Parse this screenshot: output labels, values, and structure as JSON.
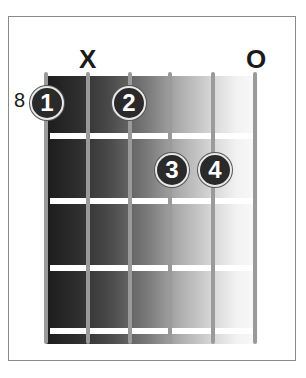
{
  "diagram": {
    "type": "guitar-chord-chart",
    "starting_fret_label": "8",
    "string_markers": [
      {
        "string": 2,
        "label": "X",
        "meaning": "muted"
      },
      {
        "string": 6,
        "label": "O",
        "meaning": "open"
      }
    ],
    "fingers": [
      {
        "label": "1",
        "string": 1,
        "fret": 1
      },
      {
        "label": "2",
        "string": 3,
        "fret": 1
      },
      {
        "label": "3",
        "string": 4,
        "fret": 2
      },
      {
        "label": "4",
        "string": 5,
        "fret": 2
      }
    ],
    "strings_count": 6,
    "frets_shown": 4,
    "colors": {
      "finger_fill": "#2a2a2a",
      "finger_text": "#ffffff",
      "string": "#9a9a9a",
      "fret": "#ffffff",
      "border": "#8a8a8a"
    }
  }
}
